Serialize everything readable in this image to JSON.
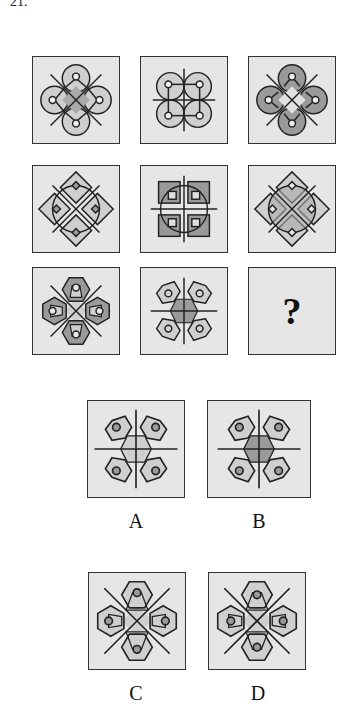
{
  "question": {
    "number": "21."
  },
  "grid": {
    "rows": [
      {
        "cells": [
          {
            "id": "r1c1",
            "motif": "circles-diagonal-x",
            "center_shaded": true,
            "lobe_fill": "light"
          },
          {
            "id": "r1c2",
            "motif": "circles-square-plus",
            "center_shaded": false,
            "lobe_fill": "light"
          },
          {
            "id": "r1c3",
            "motif": "circles-diagonal-x",
            "center_shaded": false,
            "lobe_fill": "dark"
          }
        ]
      },
      {
        "cells": [
          {
            "id": "r2c1",
            "motif": "diamonds-diagonal-x",
            "center_shaded": false,
            "lobe_fill": "light"
          },
          {
            "id": "r2c2",
            "motif": "squares-circle-plus",
            "center_shaded": false,
            "lobe_fill": "dark"
          },
          {
            "id": "r2c3",
            "motif": "diamonds-diagonal-x",
            "center_shaded": true,
            "lobe_fill": "light"
          }
        ]
      },
      {
        "cells": [
          {
            "id": "r3c1",
            "motif": "hexagons-diagonal-x",
            "center_shaded": false,
            "lobe_fill": "dark"
          },
          {
            "id": "r3c2",
            "motif": "hexagons-plus",
            "center_shaded": true,
            "lobe_fill": "light"
          },
          {
            "id": "r3c3",
            "motif": "unknown",
            "text": "?"
          }
        ]
      }
    ]
  },
  "options": [
    {
      "label": "A",
      "motif": "hexagons-plus",
      "center_shaded": "light",
      "lobe_fill": "light"
    },
    {
      "label": "B",
      "motif": "hexagons-plus",
      "center_shaded": "dark",
      "lobe_fill": "light"
    },
    {
      "label": "C",
      "motif": "hexagons-diagonal-x",
      "center_shaded": "light",
      "lobe_fill": "light"
    },
    {
      "label": "D",
      "motif": "hexagons-diagonal-x",
      "center_shaded": "light",
      "lobe_fill": "light"
    }
  ],
  "colors": {
    "cell_bg": "#e6e6e6",
    "light_fill": "#cfcfcf",
    "dark_fill": "#9a9a9a",
    "stroke": "#222222"
  }
}
